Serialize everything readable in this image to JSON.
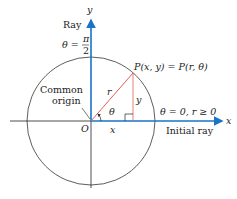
{
  "diagram": {
    "axes": {
      "x_label": "x",
      "y_label": "y",
      "origin_label": "O"
    },
    "ray_label": "Ray",
    "ray_theta_prefix": "θ =",
    "ray_theta_num": "π",
    "ray_theta_den": "2",
    "common_origin_line1": "Common",
    "common_origin_line2": "origin",
    "point_label": "P(x, y) = P(r, θ)",
    "r_label": "r",
    "y_leg_label": "y",
    "x_leg_label": "x",
    "angle_label": "θ",
    "initial_ray_condition": "θ = 0, r ≥ 0",
    "initial_ray_label": "Initial ray",
    "colors": {
      "axis_blue": "#1a73c6",
      "radius_red": "#e0605a",
      "circle": "#333333"
    }
  }
}
